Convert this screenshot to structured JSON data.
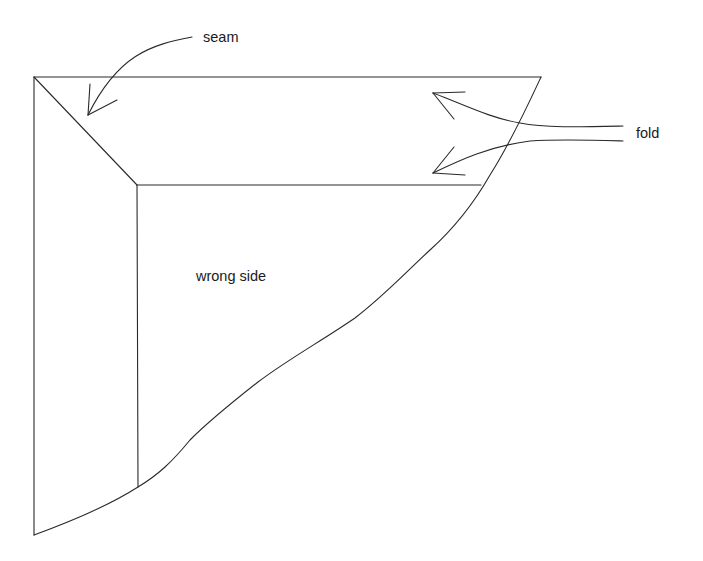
{
  "diagram": {
    "labels": {
      "seam": "seam",
      "fold": "fold",
      "wrong_side": "wrong side"
    },
    "colors": {
      "line": "#2a2a2a",
      "text": "#1a1a1a",
      "background": "#ffffff"
    }
  }
}
